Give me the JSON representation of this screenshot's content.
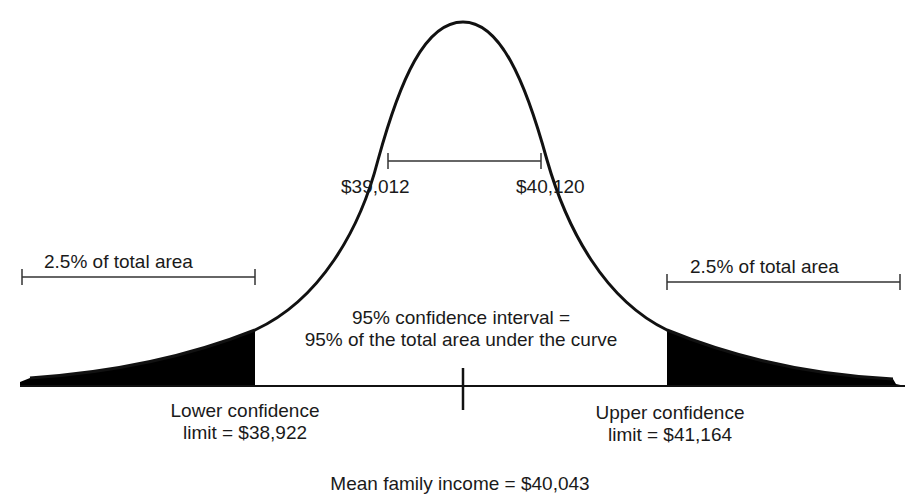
{
  "diagram": {
    "inner_interval": {
      "left": "$39,012",
      "right": "$40,120"
    },
    "left_tail_label": "2.5% of total area",
    "right_tail_label": "2.5% of total area",
    "center_text": {
      "line1": "95% confidence interval =",
      "line2": "95% of the total area under the curve"
    },
    "lower_limit": {
      "line1": "Lower confidence",
      "line2": "limit = $38,922"
    },
    "upper_limit": {
      "line1": "Upper confidence",
      "line2": "limit = $41,164"
    },
    "mean_label": "Mean family income = $40,043",
    "colors": {
      "curve": "#111111",
      "tail_fill": "#000000",
      "bracket": "#333333"
    }
  }
}
